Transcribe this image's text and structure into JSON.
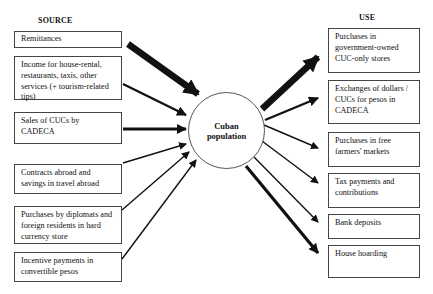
{
  "headings": {
    "source": "SOURCE",
    "use": "USE"
  },
  "center": {
    "label_line1": "Cuban",
    "label_line2": "population"
  },
  "sources": [
    {
      "label": "Remittances",
      "arrow_weight": "very-heavy"
    },
    {
      "label": "Income for house-rental, restaurants, taxis, other services (+ tourism-related tips)",
      "arrow_weight": "medium"
    },
    {
      "label": "Sales of CUCs by CADECA",
      "arrow_weight": "heavy"
    },
    {
      "label": "Contracts abroad and savings in travel abroad",
      "arrow_weight": "light"
    },
    {
      "label": "Purchases by diplomats and foreign residents in hard currency store",
      "arrow_weight": "light"
    },
    {
      "label": "Incentive payments in convertible pesos",
      "arrow_weight": "light"
    }
  ],
  "uses": [
    {
      "label": "Purchases in government-owned CUC-only stores",
      "arrow_weight": "very-heavy"
    },
    {
      "label": "Exchanges of dollars / CUCs for pesos in CADECA",
      "arrow_weight": "medium"
    },
    {
      "label": "Purchases in free farmers' markets",
      "arrow_weight": "light"
    },
    {
      "label": "Tax payments and contributions",
      "arrow_weight": "light"
    },
    {
      "label": "Bank deposits",
      "arrow_weight": "light"
    },
    {
      "label": "House hoarding",
      "arrow_weight": "heavy"
    }
  ],
  "colors": {
    "line": "#111111",
    "border": "#444444",
    "background": "#ffffff"
  }
}
